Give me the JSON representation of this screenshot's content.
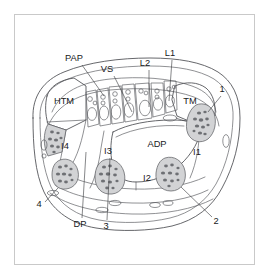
{
  "figure": {
    "kind": "anatomical-cross-section",
    "frame_color": "#c9c9c9",
    "background_color": "#ffffff",
    "line_color": "#4a4c50",
    "muscle_fill_color": "#d2d3d5",
    "muscle_speckle_color": "#6e7074",
    "vessel_fill_color": "#d8eef0",
    "label_color": "#17191c"
  },
  "labels": {
    "abbreviations": [
      {
        "id": "pap",
        "text": "PAP",
        "x": 74,
        "y": 61,
        "leader": [
          [
            82,
            65
          ],
          [
            104,
            96
          ]
        ]
      },
      {
        "id": "vs",
        "text": "VS",
        "x": 107,
        "y": 72,
        "leader": [
          [
            114,
            76
          ],
          [
            132,
            112
          ]
        ]
      },
      {
        "id": "l2",
        "text": "L2",
        "x": 145,
        "y": 66,
        "leader": [
          [
            149,
            70
          ],
          [
            149,
            107
          ]
        ]
      },
      {
        "id": "l1",
        "text": "L1",
        "x": 170,
        "y": 56,
        "leader": [
          [
            172,
            60
          ],
          [
            169,
            101
          ]
        ]
      },
      {
        "id": "htm",
        "text": "HTM",
        "x": 46,
        "y": 104
      },
      {
        "id": "tm",
        "text": "TM",
        "x": 186,
        "y": 104
      },
      {
        "id": "i4",
        "text": "I4",
        "x": 62,
        "y": 147
      },
      {
        "id": "i3",
        "text": "I3",
        "x": 107,
        "y": 152
      },
      {
        "id": "adp",
        "text": "ADP",
        "x": 152,
        "y": 146
      },
      {
        "id": "i1",
        "text": "I1",
        "x": 196,
        "y": 154
      },
      {
        "id": "i2",
        "text": "I2",
        "x": 146,
        "y": 180
      },
      {
        "id": "dp",
        "text": "DP",
        "x": 76,
        "y": 224,
        "leader": [
          [
            82,
            218
          ],
          [
            86,
            158
          ]
        ]
      },
      {
        "id": "num3",
        "text": "3",
        "x": 105,
        "y": 226,
        "leader": [
          [
            107,
            220
          ],
          [
            110,
            160
          ]
        ]
      }
    ],
    "numbers": [
      {
        "id": "num1",
        "text": "1",
        "x": 222,
        "y": 92,
        "leader": [
          [
            221,
            96
          ],
          [
            208,
            112
          ]
        ]
      },
      {
        "id": "num2",
        "text": "2",
        "x": 215,
        "y": 222,
        "leader": [
          [
            213,
            217
          ],
          [
            181,
            187
          ]
        ]
      },
      {
        "id": "num4",
        "text": "4",
        "x": 40,
        "y": 205,
        "leader": [
          [
            45,
            202
          ],
          [
            58,
            188
          ]
        ]
      }
    ]
  },
  "legend_keys": {
    "PAP": "palmar aponeurosis / palmar arterial plexus",
    "VS": "vascular structure",
    "L1": "lumbrical 1",
    "L2": "lumbrical 2",
    "HTM": "hypothenar muscles",
    "TM": "thenar muscles",
    "ADP": "adductor pollicis",
    "DP": "deep palmar structures",
    "I1": "interosseous 1",
    "I2": "interosseous 2",
    "I3": "interosseous 3",
    "I4": "interosseous 4"
  }
}
